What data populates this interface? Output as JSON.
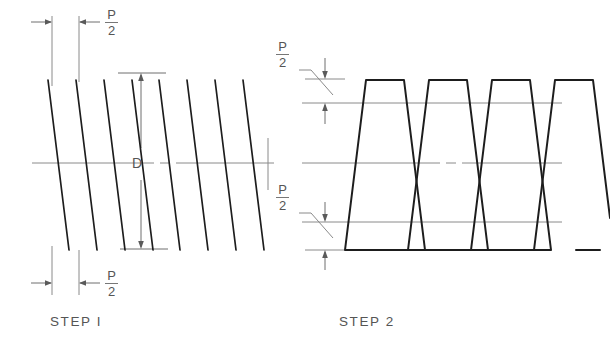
{
  "figure": {
    "title_step1": "STEP I",
    "title_step2": "STEP 2",
    "dim_major_letter": "D",
    "fraction": {
      "numerator": "P",
      "denominator": "2"
    },
    "line_color": "#1d1d1d",
    "thin_line_color": "#8a8a8a",
    "text_color": "#555555",
    "background": "#ffffff"
  },
  "labels": {
    "step1_top_p2": {
      "numerator": "P",
      "denominator": "2"
    },
    "step1_bottom_p2": {
      "numerator": "P",
      "denominator": "2"
    },
    "step2_top_p2": {
      "numerator": "P",
      "denominator": "2"
    },
    "step2_bottom_p2": {
      "numerator": "P",
      "denominator": "2"
    },
    "step1_major_dia": "D"
  },
  "geometry": {
    "step1": {
      "thread_count": 8,
      "thread_start_x": [
        48,
        76,
        104,
        132,
        159,
        187,
        215,
        243
      ],
      "thread_top_y": 80,
      "thread_bottom_y": 250,
      "slant_dx": 21,
      "centerline_y": 163,
      "centerline_x_start": 32,
      "centerline_x_end": 274,
      "centerline_gap": [
        156,
        174
      ],
      "d_dim_x": 140,
      "d_dim_top_y": 73,
      "d_dim_bottom_y": 249,
      "ext_line_top_x": [
        118,
        165
      ],
      "ext_line_bottom_x": [
        120,
        167
      ],
      "p2_top_dim_y": 22,
      "p2_bottom_dim_y": 283,
      "ext_vertical_x": [
        52,
        79
      ],
      "right_tick_x": 268
    },
    "step2": {
      "thread_count": 4,
      "thread_pitch": 63,
      "thread_first_x": 345,
      "thread_top_y": 79,
      "thread_bottom_y": 250,
      "thread_crest_width": 38,
      "thread_slant_dx": 21,
      "upper_ref_line_y": 103,
      "lower_ref_line_y": 222,
      "centerline_y": 163,
      "ref_line_x_start": 302,
      "ref_line_x_end": 562,
      "centerline_gap": [
        442,
        460
      ],
      "p2_top_dim_y_from": 79,
      "p2_top_dim_y_to": 103,
      "p2_bottom_dim_y_from": 222,
      "p2_bottom_dim_y_to": 250,
      "p2_dim_x": 325
    }
  }
}
